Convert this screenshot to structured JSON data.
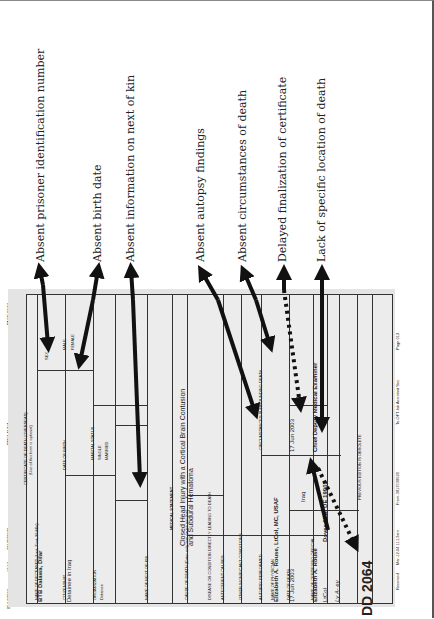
{
  "annotations": [
    {
      "label": "Absent prisoner identification number"
    },
    {
      "label": "Absent birth date"
    },
    {
      "label": "Absent information on next of kin"
    },
    {
      "label": "Absent autopsy findings"
    },
    {
      "label": "Absent circumstances of death"
    },
    {
      "label": "Delayed finalization of certificate"
    },
    {
      "label": "Lack of specific location of death"
    }
  ],
  "fax_header": {
    "date": "05/14/2004",
    "time": "12:14",
    "number": "3813538620",
    "sender": "PEN/LAUNA",
    "page": "PAGE 03/07"
  },
  "form": {
    "title": "CERTIFICATE OF DEATH (OVERSEAS)",
    "subtitle": "(Use of this form is optional)",
    "deceased_name_label": "NAME OF DECEASED (Last, First, Middle)",
    "deceased_name": "BTB Dalawa, Dilar",
    "citizenship_label": "CITIZENSHIP",
    "citizenship": "Detainee in Iraq",
    "organization_label": "ORGANIZATION",
    "organization": "Detainee",
    "sex_label": "SEX",
    "sex_options": [
      "MALE",
      "FEMALE"
    ],
    "sex_checked": "MALE",
    "race_label": "RACE",
    "birth_date_label": "DATE OF BIRTH",
    "birth_place_label": "PLACE OF BIRTH",
    "marital_status_label": "MARITAL STATUS",
    "marital_options": [
      "SINGLE",
      "MARRIED",
      "WIDOWED",
      "DIVORCED",
      "SEPARATED"
    ],
    "next_of_kin_label": "NAME OF NEXT OF KIN",
    "medical_statement_label": "MEDICAL STATEMENT",
    "cause_of_death_label": "CAUSE OF DEATH (Enter only one cause per line)",
    "cause_of_death": "Closed Head Injury with a Cortical Brain Contusion and Subdural Hematoma",
    "interval_label": "INTERVAL BETWEEN ONSET AND DEATH",
    "disease_label": "DISEASE OR CONDITION DIRECTLY LEADING TO DEATH",
    "antecedent_label": "ANTECEDENT CAUSES",
    "other_conditions_label": "OTHER SIGNIFICANT CONDITIONS",
    "autopsy_label": "AUTOPSY PERFORMED",
    "autopsy_options": [
      "YES",
      "NO"
    ],
    "autopsy_checked": "YES",
    "circumstances_label": "CIRCUMSTANCES SURROUNDING DEATH",
    "physician_name_label": "NAME OF PHYSICIAN",
    "physician_name": "Elizabeth A. Rouse, LtCol, MC, USAF",
    "death_date_label": "DATE OF DEATH",
    "death_date": "17 Jun 2003",
    "signed_date_label": "DATE SIGNED",
    "signed_date": "Iraq",
    "certifier_label": "NAME OF CERTIFYING OFFICIAL",
    "certifier_name": "Elizabeth A. Rouse",
    "certifier_grade": "LtCol",
    "certifier_title": "Chief Deputy Medical Examiner",
    "certifier_address": "Dover AFB, DE 19902",
    "signature": "Ly A- ey",
    "manner_options": [
      "NATURAL",
      "ACCIDENT",
      "SUICIDE",
      "HOMICIDE",
      "PENDING",
      "UNDETERMINED"
    ],
    "manner_checked": "HOMICIDE",
    "death_date_2": "17 Jun 2003",
    "form_number": "DD FORM 2064",
    "form_id": "2064",
    "form_prefix": "DD",
    "form_edition": "PREVIOUS EDITION IS OBSOLETE"
  },
  "fax_footer": {
    "received": "Received",
    "date_time": "Mar-12-04   11:13am",
    "from": "From-3813538620",
    "to": "To-OFT-lab Assistant Sec",
    "page": "Page 012"
  }
}
